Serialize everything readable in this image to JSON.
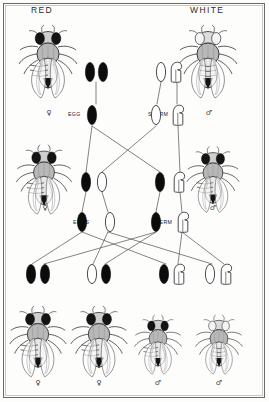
{
  "figure": {
    "title_left": "RED",
    "title_right": "WHITE",
    "background": "#fdfdfc",
    "ink": "#111111",
    "line_color": "#4a4a4a"
  },
  "labels": {
    "egg": "EGG",
    "sperm": "SPERM",
    "eggs": "EGGS",
    "sperm2": "SPERM"
  },
  "symbols": {
    "female": "♀",
    "male": "♂"
  },
  "generations": {
    "parental": {
      "name": "parental",
      "flies": [
        {
          "phenotype": "RED",
          "sex": "♀",
          "x": 48,
          "y": 28,
          "scale": 1.0
        },
        {
          "phenotype": "WHITE",
          "sex": "♂",
          "x": 208,
          "y": 28,
          "scale": 1.0
        }
      ],
      "genotypes": [
        {
          "owner": "red-female",
          "chromosomes": [
            "X-red",
            "X-red"
          ],
          "x": 96,
          "y": 70
        },
        {
          "owner": "white-male",
          "chromosomes": [
            "X-white",
            "Y"
          ],
          "x": 168,
          "y": 70
        }
      ]
    },
    "gametes_p": {
      "egg": {
        "label": "EGG",
        "chromosomes": [
          "X-red"
        ],
        "x": 93,
        "y": 114
      },
      "sperm": {
        "label": "SPERM",
        "chromosomes": [
          "X-white",
          "Y"
        ],
        "x": 160,
        "y": 114
      }
    },
    "f1": {
      "name": "F1",
      "flies": [
        {
          "phenotype": "RED",
          "sex": "♀",
          "x": 44,
          "y": 148,
          "scale": 0.95
        },
        {
          "phenotype": "RED",
          "sex": "♂",
          "x": 212,
          "y": 148,
          "scale": 0.9
        }
      ],
      "genotypes": [
        {
          "owner": "f1-female",
          "chromosomes": [
            "X-red",
            "X-white"
          ],
          "x": 94,
          "y": 182
        },
        {
          "owner": "f1-male",
          "chromosomes": [
            "X-red",
            "Y"
          ],
          "x": 166,
          "y": 182
        }
      ]
    },
    "gametes_f1": {
      "eggs": {
        "label": "EGGS",
        "chromosomes": [
          "X-red",
          "X-white"
        ],
        "x": 90,
        "y": 222
      },
      "sperm": {
        "label": "SPERM",
        "chromosomes": [
          "X-red",
          "Y"
        ],
        "x": 164,
        "y": 222
      }
    },
    "f2": {
      "name": "F2",
      "genotypes": [
        {
          "chromosomes": [
            "X-red",
            "X-red"
          ],
          "x": 37,
          "y": 272
        },
        {
          "chromosomes": [
            "X-white",
            "X-red"
          ],
          "x": 98,
          "y": 272
        },
        {
          "chromosomes": [
            "X-red",
            "Y"
          ],
          "x": 157,
          "y": 272
        },
        {
          "chromosomes": [
            "X-white",
            "Y"
          ],
          "x": 218,
          "y": 272
        }
      ],
      "flies": [
        {
          "phenotype": "RED",
          "sex": "♀",
          "x": 37,
          "y": 330,
          "scale": 0.95
        },
        {
          "phenotype": "RED",
          "sex": "♀",
          "x": 98,
          "y": 330,
          "scale": 0.95
        },
        {
          "phenotype": "RED",
          "sex": "♂",
          "x": 157,
          "y": 332,
          "scale": 0.8
        },
        {
          "phenotype": "WHITE",
          "sex": "♂",
          "x": 218,
          "y": 332,
          "scale": 0.8
        }
      ]
    }
  }
}
